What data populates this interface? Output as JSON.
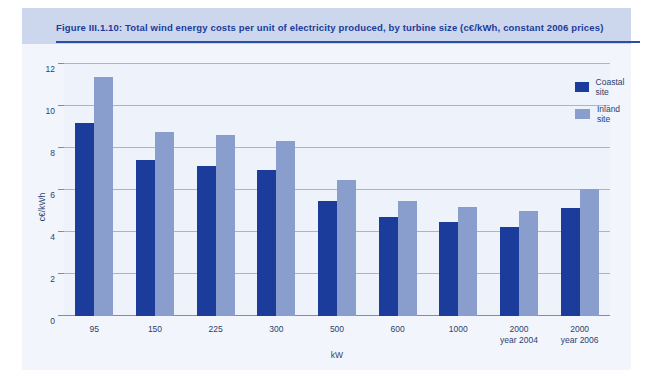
{
  "figure": {
    "title": "Figure III.1.10: Total wind energy costs per unit of electricity produced, by turbine size (c€/kWh, constant 2006 prices)",
    "source": "Source: Risø DTU",
    "colors": {
      "coastal": "#1b3c9b",
      "inland": "#8a9ecd",
      "header_band": "#ccd6ec",
      "panel": "#f2f6fc",
      "plot_background": "#eef2fb",
      "gridline": "#9aa9cf",
      "text": "#2b3f6e",
      "title_text": "#1b3c9b"
    }
  },
  "chart_data": {
    "type": "bar",
    "title": "Total wind energy costs per unit of electricity produced, by turbine size (c€/kWh, constant 2006 prices)",
    "xlabel": "kW",
    "ylabel": "c€/kWh",
    "ylim": [
      0,
      12
    ],
    "yticks": [
      0,
      2,
      4,
      6,
      8,
      10,
      12
    ],
    "ytick_labels": [
      "0",
      "2",
      "4",
      "6",
      "8",
      "10",
      "12"
    ],
    "grid": true,
    "legend_position": "top-right",
    "categories": [
      "95",
      "150",
      "225",
      "300",
      "500",
      "600",
      "1000",
      "2000",
      "2000"
    ],
    "category_sublabels": [
      "",
      "",
      "",
      "",
      "",
      "",
      "",
      "year 2004",
      "year 2006"
    ],
    "series": [
      {
        "name": "Coastal site",
        "color": "#1b3c9b",
        "values": [
          9.2,
          7.45,
          7.15,
          6.95,
          5.5,
          4.7,
          4.5,
          4.25,
          5.15
        ]
      },
      {
        "name": "Inland site",
        "color": "#8a9ecd",
        "values": [
          11.4,
          8.75,
          8.6,
          8.35,
          6.5,
          5.5,
          5.2,
          5.0,
          6.05
        ]
      }
    ]
  }
}
